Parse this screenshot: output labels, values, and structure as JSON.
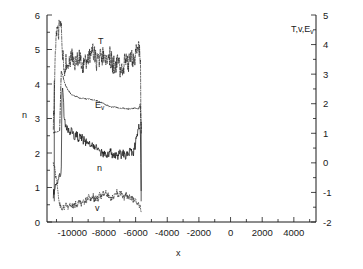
{
  "chart_data": {
    "type": "line",
    "title": "",
    "xlabel": "x",
    "ylabel_left": "n",
    "ylabel_right": "T,v,Ev",
    "grid": false,
    "legend_position": "inline-annotations",
    "xlim": [
      -11600,
      5400
    ],
    "xticks": [
      -10000,
      -8000,
      -6000,
      -4000,
      -2000,
      0,
      2000,
      4000
    ],
    "xtick_labels": [
      "-10000",
      "-8000",
      "-6000",
      "-4000",
      "-2000",
      "0",
      "2000",
      "4000"
    ],
    "x_minor_step": 1000,
    "ylim_left": [
      0,
      6
    ],
    "yticks_left": [
      0,
      1,
      2,
      3,
      4,
      5,
      6
    ],
    "ytick_labels_left": [
      "0",
      "1",
      "2",
      "3",
      "4",
      "5",
      "6"
    ],
    "y_minor_step_left": 0.5,
    "ylim_right": [
      -2,
      5
    ],
    "yticks_right": [
      -2,
      -1,
      0,
      1,
      2,
      3,
      4,
      5
    ],
    "ytick_labels_right": [
      "-2",
      "-1",
      "0",
      "1",
      "2",
      "3",
      "4",
      "5"
    ],
    "y_minor_step_right": 0.5,
    "data_x_start": -11200,
    "data_x_end": -5650,
    "series": [
      {
        "name": "T",
        "axis": "right",
        "style": "noisy-dash-dot",
        "label": "T",
        "x": [
          -11200,
          -11050,
          -10900,
          -10800,
          -10700,
          -10600,
          -10500,
          -10400,
          -10300,
          -10200,
          -10100,
          -10000,
          -9800,
          -9600,
          -9400,
          -9200,
          -9000,
          -8800,
          -8600,
          -8400,
          -8200,
          -8000,
          -7800,
          -7600,
          -7400,
          -7200,
          -7000,
          -6800,
          -6600,
          -6400,
          -6200,
          -6000,
          -5850,
          -5700,
          -5650
        ],
        "values": [
          0.9,
          4.2,
          4.8,
          4.75,
          4.6,
          3.5,
          3.3,
          3.35,
          3.4,
          3.5,
          3.45,
          3.5,
          3.55,
          3.6,
          3.6,
          3.65,
          3.6,
          3.55,
          3.5,
          3.55,
          3.5,
          3.5,
          3.5,
          3.45,
          3.4,
          3.45,
          3.4,
          3.45,
          3.4,
          3.45,
          3.5,
          3.55,
          3.6,
          3.5,
          1.0
        ],
        "noise_amp": 0.35
      },
      {
        "name": "Ev",
        "axis": "right",
        "style": "dash-dot-smooth",
        "label": "Ev",
        "x": [
          -11200,
          -11000,
          -10800,
          -10700,
          -10650,
          -10600,
          -10500,
          -10400,
          -10300,
          -10200,
          -10000,
          -9800,
          -9600,
          -9400,
          -9200,
          -9000,
          -8800,
          -8600,
          -8400,
          -8200,
          -8000,
          -7800,
          -7600,
          -7400,
          -7200,
          -7000,
          -6800,
          -6600,
          -6400,
          -6200,
          -6000,
          -5800,
          -5700,
          -5650
        ],
        "values": [
          1.0,
          1.05,
          1.1,
          3.1,
          3.05,
          2.95,
          2.75,
          2.6,
          2.5,
          2.42,
          2.3,
          2.24,
          2.2,
          2.18,
          2.17,
          2.16,
          2.15,
          2.13,
          2.1,
          2.05,
          2.0,
          1.95,
          1.9,
          1.88,
          1.86,
          1.85,
          1.84,
          1.83,
          1.84,
          1.85,
          1.85,
          1.84,
          2.0,
          1.0
        ],
        "noise_amp": 0.02
      },
      {
        "name": "n",
        "axis": "left",
        "style": "noisy-solid",
        "label": "n",
        "x": [
          -11200,
          -11100,
          -11000,
          -10900,
          -10800,
          -10700,
          -10650,
          -10600,
          -10500,
          -10400,
          -10300,
          -10200,
          -10100,
          -10000,
          -9800,
          -9600,
          -9400,
          -9200,
          -9000,
          -8800,
          -8600,
          -8400,
          -8200,
          -8000,
          -7800,
          -7600,
          -7400,
          -7200,
          -7000,
          -6800,
          -6600,
          -6400,
          -6200,
          -6000,
          -5900,
          -5800,
          -5700,
          -5650
        ],
        "values": [
          0.85,
          1.0,
          1.15,
          1.25,
          1.3,
          1.35,
          3.9,
          3.7,
          2.85,
          2.75,
          2.7,
          2.65,
          2.6,
          2.6,
          2.5,
          2.45,
          2.4,
          2.35,
          2.3,
          2.25,
          2.2,
          2.1,
          2.05,
          2.0,
          1.95,
          1.95,
          1.9,
          1.9,
          1.95,
          1.95,
          2.0,
          2.05,
          2.1,
          2.3,
          2.5,
          2.7,
          2.75,
          0.9
        ],
        "noise_amp": 0.13
      },
      {
        "name": "v",
        "axis": "right",
        "style": "noisy-dotted",
        "label": "v",
        "x": [
          -11200,
          -11100,
          -11000,
          -10900,
          -10800,
          -10700,
          -10600,
          -10500,
          -10400,
          -10200,
          -10000,
          -9800,
          -9600,
          -9400,
          -9200,
          -9000,
          -8800,
          -8600,
          -8400,
          -8200,
          -8000,
          -7800,
          -7600,
          -7400,
          -7200,
          -7000,
          -6800,
          -6600,
          -6400,
          -6200,
          -6000,
          -5800,
          -5700,
          -5650
        ],
        "values": [
          0.0,
          -0.2,
          -0.6,
          -1.1,
          -1.4,
          -1.55,
          -1.6,
          -1.55,
          -1.5,
          -1.45,
          -1.42,
          -1.38,
          -1.35,
          -1.3,
          -1.28,
          -1.25,
          -1.2,
          -1.18,
          -1.15,
          -1.12,
          -1.1,
          -1.1,
          -1.08,
          -1.08,
          -1.08,
          -1.1,
          -1.1,
          -1.12,
          -1.15,
          -1.18,
          -1.25,
          -1.4,
          -1.5,
          -1.6
        ],
        "noise_amp": 0.12
      }
    ],
    "annotations": [
      {
        "text": "T",
        "name": "curve-label-T"
      },
      {
        "text": "E",
        "sub": "v",
        "name": "curve-label-Ev"
      },
      {
        "text": "n",
        "name": "curve-label-n"
      },
      {
        "text": "v",
        "name": "curve-label-v"
      }
    ]
  },
  "labels": {
    "x_axis_title": "x",
    "y_left_title": "n",
    "y_right_title_main": "T,v,E",
    "y_right_title_sub": "v",
    "ann_T": "T",
    "ann_E": "E",
    "ann_E_sub": "v",
    "ann_n": "n",
    "ann_v": "v"
  },
  "colors": {
    "axis": "#1a1a1a",
    "curve": "#111111",
    "background": "#ffffff"
  }
}
